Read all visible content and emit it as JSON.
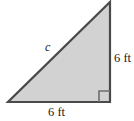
{
  "figure": {
    "name": "right-triangle-figure",
    "shape": "right triangle",
    "fill_color": "#d2d2d2",
    "stroke_color": "#4a4a4a",
    "background_color": "#ffffff",
    "labels": {
      "hypotenuse": "c",
      "right_leg": "6 ft",
      "bottom_leg": "6 ft"
    },
    "right_angle_marker": {
      "name": "right-angle-marker",
      "vertex": "bottom-right",
      "size": 10
    },
    "geometry": {
      "vertices": {
        "bottom_left": [
          8,
          102
        ],
        "bottom_right": [
          110,
          102
        ],
        "top_right": [
          110,
          2
        ]
      },
      "leg_lengths": [
        "6 ft",
        "6 ft"
      ],
      "hypotenuse_label": "c"
    }
  }
}
